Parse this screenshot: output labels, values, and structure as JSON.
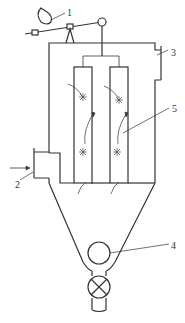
{
  "diagram": {
    "type": "bag filter (pulse-jet dust collector) schematic",
    "colors": {
      "stroke": "#333333",
      "background": "#ffffff"
    },
    "labels": [
      {
        "id": "1",
        "text": "1",
        "x": 67,
        "y": 8
      },
      {
        "id": "2",
        "text": "2",
        "x": 15,
        "y": 180
      },
      {
        "id": "3",
        "text": "3",
        "x": 171,
        "y": 48
      },
      {
        "id": "4",
        "text": "4",
        "x": 171,
        "y": 241
      },
      {
        "id": "5",
        "text": "5",
        "x": 172,
        "y": 104
      }
    ],
    "components": [
      {
        "id": "1",
        "name": "pulse valve / actuator lever"
      },
      {
        "id": "2",
        "name": "dirty gas inlet"
      },
      {
        "id": "3",
        "name": "clean gas outlet"
      },
      {
        "id": "4",
        "name": "screw conveyor / dust discharge"
      },
      {
        "id": "5",
        "name": "filter bags"
      }
    ]
  }
}
